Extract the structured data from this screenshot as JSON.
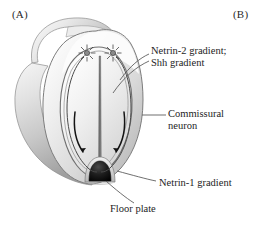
{
  "figure": {
    "panels": [
      {
        "tag": "(A)",
        "name": "panel-a"
      },
      {
        "tag": "(B)",
        "name": "panel-b"
      }
    ],
    "labels": {
      "netrin2_line1": "Netrin-2 gradient;",
      "netrin2_line2": "Shh gradient",
      "commissural_line1": "Commissural",
      "commissural_line2": "neuron",
      "netrin1": "Netrin-1 gradient",
      "floor_plate": "Floor plate"
    },
    "structures": {
      "neural_tube": "neural-tube-body",
      "lumen": "central-canal-lumen",
      "floor_plate": "floor-plate-dark-arch",
      "neuron_left": "commissural-neuron-star-left",
      "neuron_right": "commissural-neuron-star-right",
      "axon_left": "axon-trajectory-left",
      "axon_right": "axon-trajectory-right",
      "arrow_left": "growth-direction-arrow-left",
      "arrow_right": "growth-direction-arrow-right"
    },
    "colors": {
      "background": "#ffffff",
      "tissue_light": "#f2f2f2",
      "tissue_mid": "#d7d7d7",
      "tissue_dark": "#a9a9a9",
      "tissue_shadow": "#8d8d8d",
      "outline": "#6f6f6f",
      "floor_plate": "#1c1c1c",
      "ink": "#1d1d1d",
      "leader": "#555555"
    }
  }
}
